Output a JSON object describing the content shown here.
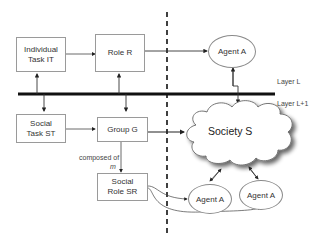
{
  "diagram": {
    "boxes": {
      "individual_task": "Individual\nTask IT",
      "role": "Role R",
      "social_task": "Social\nTask ST",
      "group": "Group G",
      "social_role": "Social\nRole SR"
    },
    "agents": {
      "top": "Agent A",
      "bottom_left": "Agent  A",
      "bottom_right": "Agent A"
    },
    "society": "Society S",
    "layers": {
      "upper": "Layer L",
      "lower": "Layer L+1"
    },
    "edge_labels": {
      "composed_of": "composed of",
      "multiplicity": "m"
    },
    "colors": {
      "line": "#333333",
      "box_border": "#9a9a9a",
      "layer_bar": "#111111"
    }
  }
}
